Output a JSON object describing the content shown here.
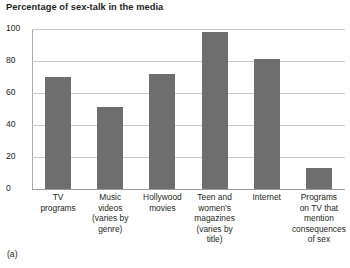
{
  "figure": {
    "panel_letter": "(a)"
  },
  "chart_data": {
    "type": "bar",
    "title": "Percentage of sex-talk in the media",
    "xlabel": "",
    "ylabel": "",
    "ylim": [
      0,
      100
    ],
    "yticks": [
      0,
      20,
      40,
      60,
      80,
      100
    ],
    "ytick_labels": [
      "0",
      "20",
      "40",
      "60",
      "80",
      "100"
    ],
    "grid": true,
    "legend": "none",
    "bar_color": "#6e6e6e",
    "gridline_color": "#c9c9c9",
    "axis_color": "#9a9a9a",
    "categories": [
      "TV\nprograms",
      "Music\nvideos\n(varies by\ngenre)",
      "Hollywood\nmovies",
      "Teen and\nwomen's\nmagazines\n(varies by\ntitle)",
      "Internet",
      "Programs\non TV that\nmention\nconsequences\nof sex"
    ],
    "category_lines": [
      [
        "TV",
        "programs"
      ],
      [
        "Music",
        "videos",
        "(varies by",
        "genre)"
      ],
      [
        "Hollywood",
        "movies"
      ],
      [
        "Teen and",
        "women's",
        "magazines",
        "(varies by",
        "title)"
      ],
      [
        "Internet"
      ],
      [
        "Programs",
        "on TV that",
        "mention",
        "consequences",
        "of sex"
      ]
    ],
    "values": [
      70,
      51,
      72,
      98,
      81,
      13
    ],
    "series": [
      {
        "name": "Percentage of sex-talk",
        "values": [
          70,
          51,
          72,
          98,
          81,
          13
        ]
      }
    ]
  }
}
